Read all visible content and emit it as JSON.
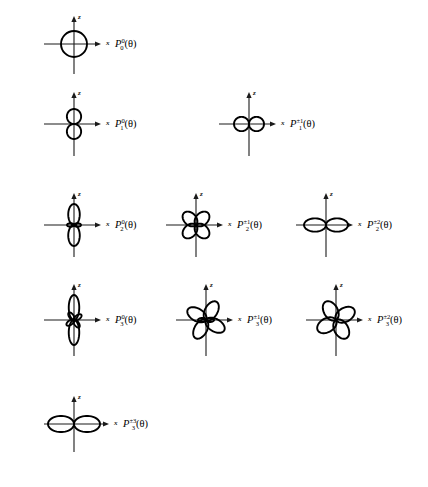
{
  "figure": {
    "type": "polar-plot-array",
    "axis_labels": {
      "vertical": "z",
      "horizontal": "x"
    },
    "curve_color": "#000000",
    "axis_color": "#1a1a1a",
    "background": "#ffffff",
    "argument": "(θ)"
  },
  "chart_data": {
    "type": "line",
    "title": "",
    "xlabel": "x",
    "ylabel": "z",
    "grid": false,
    "legend": false,
    "coordinate_system": "polar",
    "note": "Each panel plots r = |P_l^m(cosθ)| in the x-z plane; lobe counts and orientation read from the figure.",
    "panels": [
      {
        "id": "P0_0",
        "label_base": "P",
        "label_sup": "0",
        "label_sub": "0",
        "label_arg": "(θ)",
        "row": 1,
        "col": 1,
        "shape": "circle",
        "lobes": 1,
        "lobe_count_description": "single sphere (isotropic)",
        "orientation_deg": 0,
        "radius": 13
      },
      {
        "id": "P1_0",
        "label_base": "P",
        "label_sup": "0",
        "label_sub": "1",
        "label_arg": "(θ)",
        "row": 2,
        "col": 1,
        "shape": "petals",
        "lobes": 2,
        "lobe_count_description": "two lobes along z",
        "orientation_deg": 90,
        "petal_length": 15,
        "petal_width": 0.95
      },
      {
        "id": "P1_pm1",
        "label_base": "P",
        "label_sup": "±1",
        "label_sub": "1",
        "label_arg": "(θ)",
        "row": 2,
        "col": 2,
        "shape": "petals",
        "lobes": 2,
        "lobe_count_description": "two lobes along x",
        "orientation_deg": 0,
        "petal_length": 15,
        "petal_width": 0.95
      },
      {
        "id": "P2_0",
        "label_base": "P",
        "label_sup": "0",
        "label_sub": "2",
        "label_arg": "(θ)",
        "row": 3,
        "col": 1,
        "shape": "petals-major-minor",
        "lobes": 2,
        "minor_lobes": 2,
        "lobe_count_description": "two large z lobes plus two small x lobes",
        "orientation_deg": 90,
        "petal_length": 21,
        "petal_width": 0.55,
        "minor_length": 7,
        "minor_width": 0.5
      },
      {
        "id": "P2_pm1",
        "label_base": "P",
        "label_sup": "±1",
        "label_sub": "2",
        "label_arg": "(θ)",
        "row": 3,
        "col": 2,
        "shape": "petals",
        "lobes": 4,
        "lobe_count_description": "four diagonal clover lobes",
        "orientation_deg": 45,
        "petal_length": 17,
        "petal_width": 0.72
      },
      {
        "id": "P2_pm2",
        "label_base": "P",
        "label_sup": "±2",
        "label_sub": "2",
        "label_arg": "(θ)",
        "row": 3,
        "col": 3,
        "shape": "petals",
        "lobes": 2,
        "lobe_count_description": "horizontal figure-eight along x",
        "orientation_deg": 0,
        "petal_length": 22,
        "petal_width": 0.6
      },
      {
        "id": "P3_0",
        "label_base": "P",
        "label_sup": "0",
        "label_sub": "3",
        "label_arg": "(θ)",
        "row": 4,
        "col": 1,
        "shape": "petals-major-minor",
        "lobes": 2,
        "minor_lobes": 4,
        "lobe_count_description": "two tall z lobes plus four small diagonal lobes",
        "orientation_deg": 90,
        "petal_length": 25,
        "petal_width": 0.42,
        "minor_length": 9,
        "minor_width": 0.5,
        "minor_orientation_deg": 35
      },
      {
        "id": "P3_pm1",
        "label_base": "P",
        "label_sup": "±1",
        "label_sub": "3",
        "label_arg": "(θ)",
        "row": 4,
        "col": 2,
        "shape": "petals-major-minor",
        "lobes": 4,
        "minor_lobes": 2,
        "lobe_count_description": "four large lobes plus two small x lobes",
        "orientation_deg": 60,
        "petal_length": 21,
        "petal_width": 0.6,
        "minor_length": 8,
        "minor_width": 0.5,
        "minor_orientation_deg": 0
      },
      {
        "id": "P3_pm2",
        "label_base": "P",
        "label_sup": "±2",
        "label_sub": "3",
        "label_arg": "(θ)",
        "row": 4,
        "col": 3,
        "shape": "petals",
        "lobes": 4,
        "lobe_count_description": "four clover lobes tilted about 30 degrees",
        "orientation_deg": 30,
        "petal_length": 21,
        "petal_width": 0.66
      },
      {
        "id": "P3_pm3",
        "label_base": "P",
        "label_sup": "±3",
        "label_sub": "3",
        "label_arg": "(θ)",
        "row": 5,
        "col": 1,
        "shape": "petals",
        "lobes": 2,
        "lobe_count_description": "horizontal figure-eight along x",
        "orientation_deg": 0,
        "petal_length": 26,
        "petal_width": 0.62
      }
    ]
  },
  "layout": {
    "panel_positions": [
      {
        "id": "P0_0",
        "cx": 74,
        "cy": 44,
        "label_x": 115,
        "label_y": 39,
        "x_tip": 101,
        "z_tip": 16,
        "x_min": 44,
        "z_max": 74
      },
      {
        "id": "P1_0",
        "cx": 74,
        "cy": 124,
        "label_x": 115,
        "label_y": 119,
        "x_tip": 101,
        "z_tip": 92,
        "x_min": 44,
        "z_max": 156
      },
      {
        "id": "P1_pm1",
        "cx": 249,
        "cy": 124,
        "label_x": 290,
        "label_y": 119,
        "x_tip": 276,
        "z_tip": 92,
        "x_min": 219,
        "z_max": 156
      },
      {
        "id": "P2_0",
        "cx": 74,
        "cy": 225,
        "label_x": 115,
        "label_y": 220,
        "x_tip": 101,
        "z_tip": 193,
        "x_min": 44,
        "z_max": 257
      },
      {
        "id": "P2_pm1",
        "cx": 196,
        "cy": 225,
        "label_x": 237,
        "label_y": 220,
        "x_tip": 223,
        "z_tip": 193,
        "x_min": 166,
        "z_max": 257
      },
      {
        "id": "P2_pm2",
        "cx": 326,
        "cy": 225,
        "label_x": 367,
        "label_y": 220,
        "x_tip": 353,
        "z_tip": 193,
        "x_min": 296,
        "z_max": 257
      },
      {
        "id": "P3_0",
        "cx": 74,
        "cy": 320,
        "label_x": 115,
        "label_y": 315,
        "x_tip": 101,
        "z_tip": 284,
        "x_min": 44,
        "z_max": 356
      },
      {
        "id": "P3_pm1",
        "cx": 206,
        "cy": 320,
        "label_x": 247,
        "label_y": 315,
        "x_tip": 233,
        "z_tip": 284,
        "x_min": 176,
        "z_max": 356
      },
      {
        "id": "P3_pm2",
        "cx": 336,
        "cy": 320,
        "label_x": 377,
        "label_y": 315,
        "x_tip": 363,
        "z_tip": 284,
        "x_min": 306,
        "z_max": 356
      },
      {
        "id": "P3_pm3",
        "cx": 74,
        "cy": 424,
        "label_x": 123,
        "label_y": 419,
        "x_tip": 109,
        "z_tip": 396,
        "x_min": 44,
        "z_max": 452
      }
    ]
  }
}
